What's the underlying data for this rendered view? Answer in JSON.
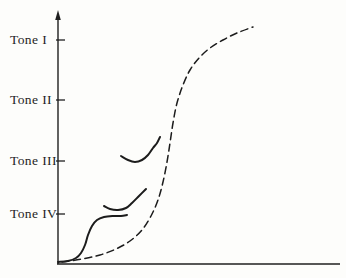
{
  "figure": {
    "background": "#fdfdfb",
    "ink_color": "#1f1f1f",
    "curve_color": "#1c1c1c"
  },
  "chart_data": {
    "type": "line",
    "title": "",
    "subtitle": "",
    "xlabel": "",
    "ylabel": "",
    "grid": false,
    "legend": null,
    "coordinate_note": "pixel coordinates, origin top-left, canvas 346x278; y-axis crossing at x=58, x-axis baseline at y=264",
    "x_axis": {
      "y": 264,
      "x1": 57,
      "x2": 340,
      "arrow": false
    },
    "y_axis": {
      "x": 58,
      "y1": 11,
      "y2": 264,
      "arrow": true
    },
    "tick_len": 9,
    "yticks": [
      {
        "label": "Tone I",
        "y": 40
      },
      {
        "label": "Tone II",
        "y": 100
      },
      {
        "label": "Tone III",
        "y": 161
      },
      {
        "label": "Tone IV",
        "y": 214
      }
    ],
    "series": [
      {
        "name": "dashed-sigmoid-development-curve",
        "style": "dashed",
        "stroke_width": 1.5,
        "dash": "7 4.5",
        "points": [
          [
            62,
            262
          ],
          [
            82,
            259
          ],
          [
            100,
            255
          ],
          [
            116,
            249
          ],
          [
            130,
            241
          ],
          [
            142,
            230
          ],
          [
            151,
            216
          ],
          [
            158,
            200
          ],
          [
            163,
            182
          ],
          [
            167,
            162
          ],
          [
            170,
            143
          ],
          [
            173,
            123
          ],
          [
            177,
            103
          ],
          [
            183,
            85
          ],
          [
            190,
            70
          ],
          [
            199,
            58
          ],
          [
            210,
            48
          ],
          [
            223,
            40
          ],
          [
            237,
            33
          ],
          [
            253,
            27
          ]
        ]
      },
      {
        "name": "solid-s-curve-tone-4-lower",
        "style": "solid",
        "stroke_width": 2,
        "dash": "",
        "points": [
          [
            58,
            262
          ],
          [
            68,
            261
          ],
          [
            76,
            258
          ],
          [
            81,
            253
          ],
          [
            85,
            245
          ],
          [
            88,
            235
          ],
          [
            92,
            226
          ],
          [
            97,
            220
          ],
          [
            104,
            217
          ],
          [
            113,
            216
          ],
          [
            121,
            216
          ],
          [
            127,
            215
          ]
        ]
      },
      {
        "name": "solid-curve-tone-4-upper",
        "style": "solid",
        "stroke_width": 2,
        "dash": "",
        "points": [
          [
            104,
            206
          ],
          [
            110,
            209
          ],
          [
            118,
            210
          ],
          [
            126,
            208
          ],
          [
            132,
            203
          ],
          [
            139,
            196
          ],
          [
            146,
            189
          ]
        ]
      },
      {
        "name": "solid-curve-tone-3",
        "style": "solid",
        "stroke_width": 2,
        "dash": "",
        "points": [
          [
            121,
            156
          ],
          [
            128,
            160
          ],
          [
            135,
            162
          ],
          [
            142,
            160
          ],
          [
            148,
            155
          ],
          [
            153,
            148
          ],
          [
            157,
            143
          ],
          [
            160,
            137
          ]
        ]
      }
    ]
  }
}
